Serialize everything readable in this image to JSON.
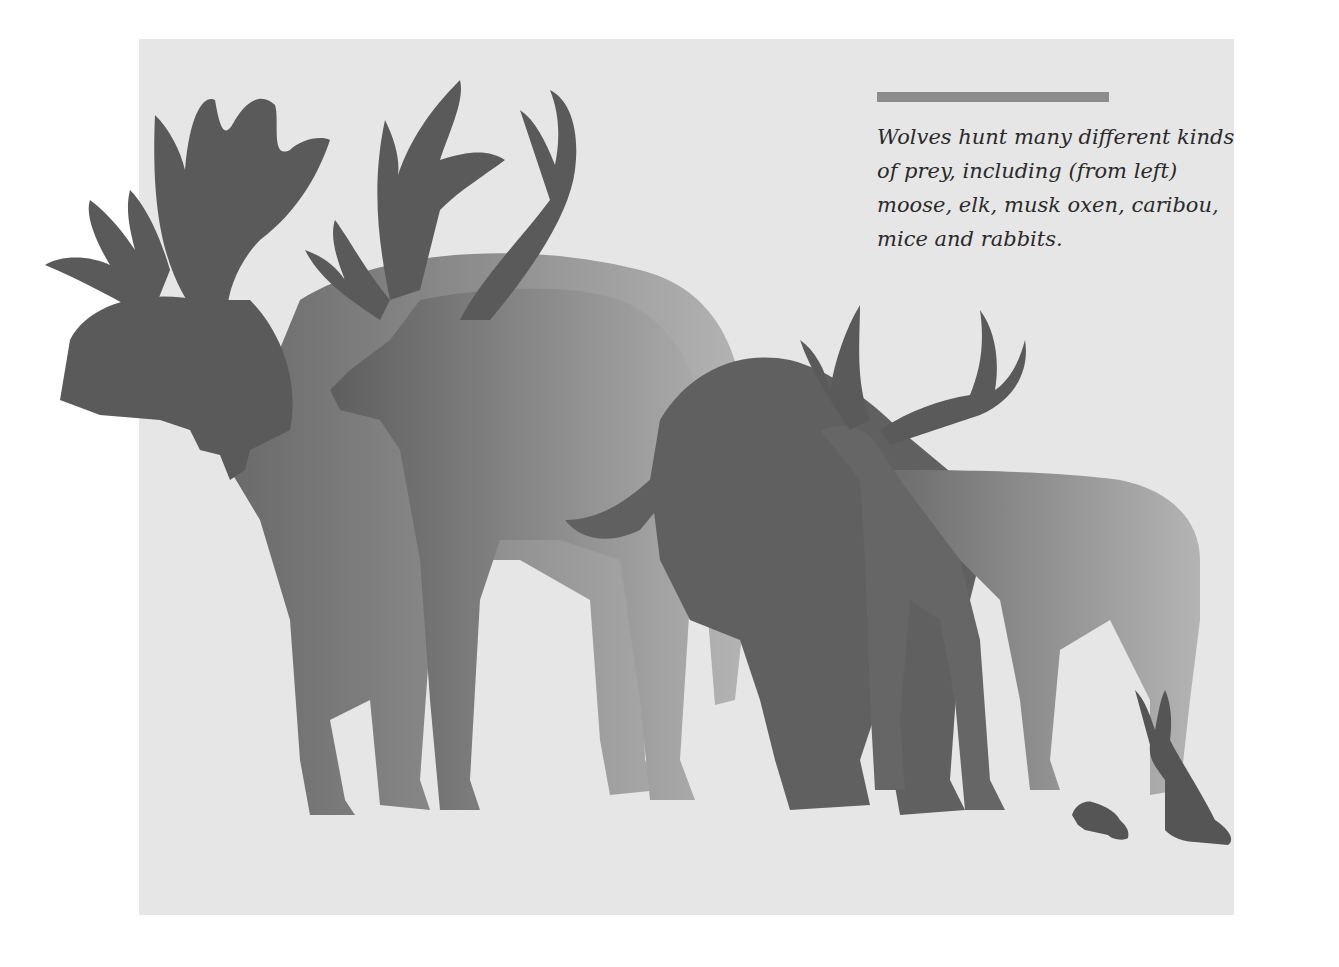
{
  "caption": {
    "text": "Wolves hunt many different kinds of prey, including (from left) moose, elk, musk oxen, caribou, mice and rabbits.",
    "rule_color": "#8c8c8c"
  },
  "illustration": {
    "animals": [
      "moose",
      "elk",
      "musk-ox",
      "caribou",
      "mouse",
      "rabbit"
    ],
    "background_color": "#e6e6e6",
    "silhouette_colors": {
      "dark": "#595959",
      "mid": "#7a7a7a",
      "light": "#a8a8a8"
    }
  }
}
